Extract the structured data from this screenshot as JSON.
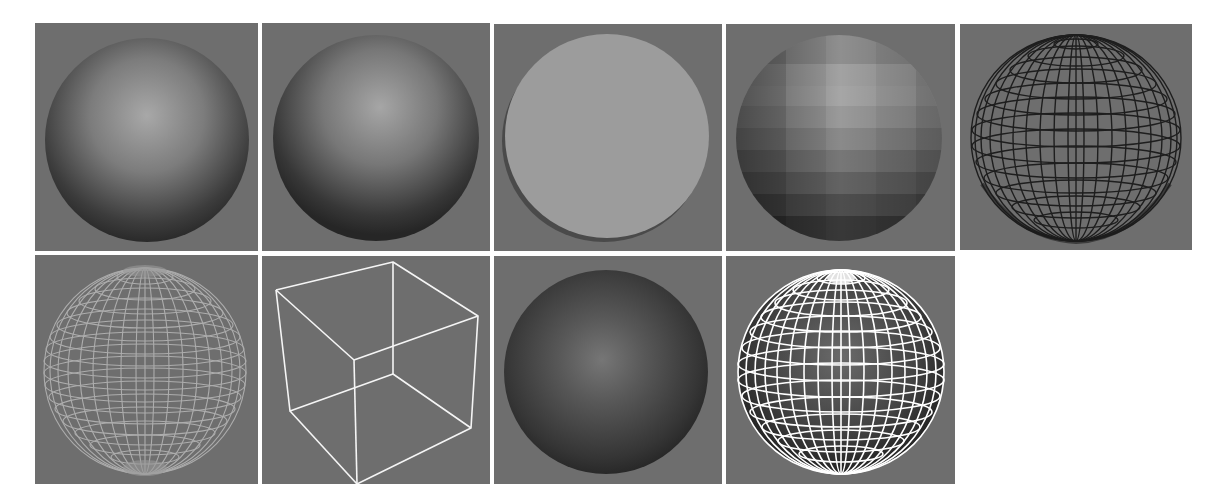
{
  "figure": {
    "background": "#ffffff",
    "panel_background": "#6e6e6e",
    "gap_color": "#f2f2f2",
    "rows": 2,
    "panels": [
      {
        "id": 1,
        "row": 1,
        "col": 1,
        "label": "Smooth shaded sphere",
        "x": 35,
        "y": 23,
        "w": 223,
        "h": 228,
        "sphere_color": "#8a8a8a",
        "highlight": "#a8a8a8",
        "shadow": "#2a2a2a"
      },
      {
        "id": 2,
        "row": 1,
        "col": 2,
        "label": "Smooth shaded sphere (lit)",
        "x": 262,
        "y": 23,
        "w": 228,
        "h": 228,
        "sphere_color": "#858585",
        "highlight": "#a6a6a6",
        "shadow": "#262626"
      },
      {
        "id": 3,
        "row": 1,
        "col": 3,
        "label": "Flat constant-shaded disc",
        "x": 494,
        "y": 24,
        "w": 228,
        "h": 227,
        "disc_color": "#9c9c9c",
        "edge_shadow": "#4a4a4a"
      },
      {
        "id": 4,
        "row": 1,
        "col": 4,
        "label": "Faceted (flat) shaded sphere",
        "x": 726,
        "y": 24,
        "w": 229,
        "h": 227,
        "bands": [
          "#a4a4a4",
          "#979797",
          "#8a8a8a",
          "#7a7a7a",
          "#686868",
          "#555555",
          "#434343",
          "#333333"
        ]
      },
      {
        "id": 5,
        "row": 1,
        "col": 5,
        "label": "Black wireframe sphere",
        "x": 960,
        "y": 24,
        "w": 232,
        "h": 226,
        "line_color": "#1e1e1e",
        "latitude_lines": 14,
        "longitude_lines": 24
      },
      {
        "id": 6,
        "row": 2,
        "col": 1,
        "label": "Grey see-through wireframe sphere",
        "x": 35,
        "y": 255,
        "w": 223,
        "h": 229,
        "line_color": "#b4b4b4",
        "latitude_lines": 18,
        "longitude_lines": 24
      },
      {
        "id": 7,
        "row": 2,
        "col": 2,
        "label": "Bounding box wireframe",
        "x": 262,
        "y": 256,
        "w": 228,
        "h": 228,
        "line_color": "#f5f5f5"
      },
      {
        "id": 8,
        "row": 2,
        "col": 3,
        "label": "Dark shaded sphere",
        "x": 494,
        "y": 256,
        "w": 228,
        "h": 228,
        "sphere_color": "#4e4e4e",
        "highlight": "#757575",
        "shadow": "#222222"
      },
      {
        "id": 9,
        "row": 2,
        "col": 4,
        "label": "Shaded sphere with white wireframe overlay",
        "x": 726,
        "y": 256,
        "w": 229,
        "h": 228,
        "line_color": "#ffffff",
        "latitude_lines": 14,
        "longitude_lines": 24,
        "sphere_color": "#4a4a4a"
      }
    ]
  }
}
